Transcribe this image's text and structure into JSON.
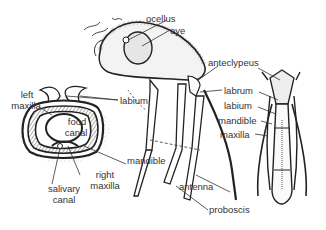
{
  "diagram": {
    "colors": {
      "ink": "#222222",
      "text": "#333333",
      "stipple": "#9a9a9a",
      "background": "#ffffff"
    },
    "panels": [
      {
        "id": "cross-section",
        "description": "cross-section of proboscis"
      },
      {
        "id": "head-lateral",
        "description": "lateral view of head with proboscis"
      },
      {
        "id": "stylets-frontal",
        "description": "frontal view of separated stylets"
      }
    ],
    "labels": {
      "ocellus": "ocellus",
      "eye": "eye",
      "anteclypeus": "anteclypeus",
      "labrum": "labrum",
      "labium_right": "labium",
      "mandible_right": "mandible",
      "maxilla": "maxilla",
      "left_maxilla_1": "left",
      "left_maxilla_2": "maxilla",
      "labium_left": "labium",
      "food_canal_1": "food",
      "food_canal_2": "canal",
      "mandible_mid": "mandible",
      "right_maxilla_1": "right",
      "right_maxilla_2": "maxilla",
      "salivary_canal_1": "salivary",
      "salivary_canal_2": "canal",
      "antenna": "antenna",
      "proboscis": "proboscis"
    }
  }
}
